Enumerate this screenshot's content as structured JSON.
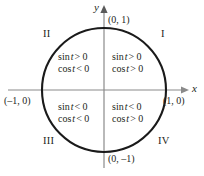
{
  "figure": {
    "colors": {
      "circle_stroke": "#1a1a1a",
      "axis_stroke": "#8a8a8a",
      "text": "#231f20",
      "background": "#ffffff"
    },
    "geometry": {
      "center_x": 104,
      "center_y": 90,
      "radius": 62,
      "x_axis_from": 8,
      "x_axis_to": 186,
      "y_axis_from": 8,
      "y_axis_to": 168
    }
  },
  "axes": {
    "x_label": "x",
    "y_label": "y"
  },
  "points": {
    "top": "(0, 1)",
    "bottom": "(0, –1)",
    "left": "(–1, 0)",
    "right": "(1, 0)"
  },
  "quadrants": [
    {
      "numeral": "I",
      "sin": {
        "fn": "sin",
        "var": "t",
        "rel": "> 0"
      },
      "cos": {
        "fn": "cos",
        "var": "t",
        "rel": "> 0"
      }
    },
    {
      "numeral": "II",
      "sin": {
        "fn": "sin",
        "var": "t",
        "rel": "> 0"
      },
      "cos": {
        "fn": "cos",
        "var": "t",
        "rel": "< 0"
      }
    },
    {
      "numeral": "III",
      "sin": {
        "fn": "sin",
        "var": "t",
        "rel": "< 0"
      },
      "cos": {
        "fn": "cos",
        "var": "t",
        "rel": "< 0"
      }
    },
    {
      "numeral": "IV",
      "sin": {
        "fn": "sin",
        "var": "t",
        "rel": "< 0"
      },
      "cos": {
        "fn": "cos",
        "var": "t",
        "rel": "> 0"
      }
    }
  ]
}
